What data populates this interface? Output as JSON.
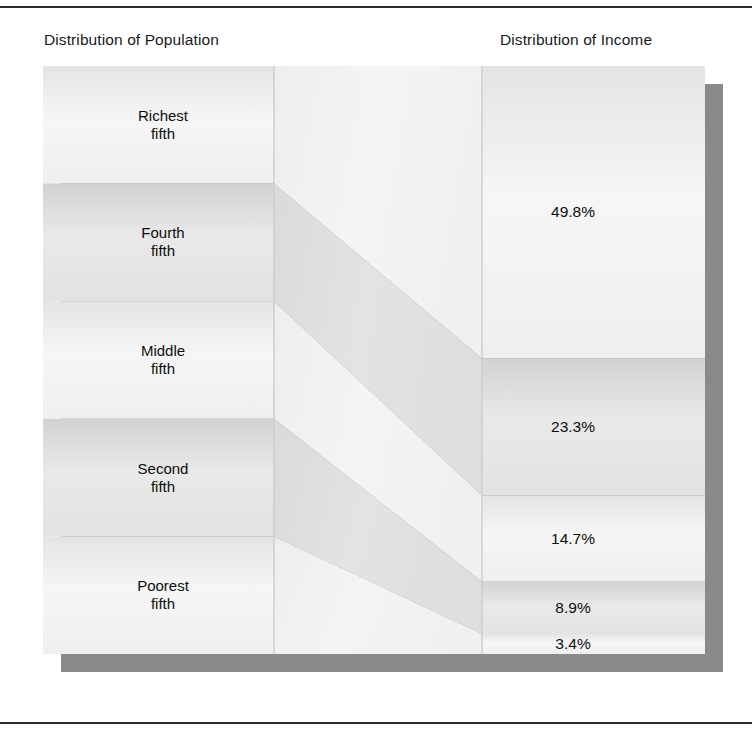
{
  "figure": {
    "left_title": "Distribution of Population",
    "right_title": "Distribution of Income",
    "background_color": "#ffffff",
    "band_light_color": "#f2f2f2",
    "band_dark_color": "#dcdcdc",
    "shadow_color": "#8a8a8a",
    "divider_color": "#c9c9c9",
    "text_color": "#0d0d0d"
  },
  "chart_data": {
    "type": "bar",
    "xlabel": "",
    "ylabel": "",
    "categories": [
      "Richest fifth",
      "Fourth fifth",
      "Middle fifth",
      "Second fifth",
      "Poorest fifth"
    ],
    "series": [
      {
        "name": "Distribution of Population",
        "values": [
          20.0,
          20.0,
          20.0,
          20.0,
          20.0
        ],
        "unit": "%"
      },
      {
        "name": "Distribution of Income",
        "values": [
          49.8,
          23.3,
          14.7,
          8.9,
          3.4
        ],
        "unit": "%"
      }
    ],
    "legend": [
      "Distribution of Population",
      "Distribution of Income"
    ],
    "grid": false,
    "ylim": [
      0,
      100
    ]
  },
  "population": {
    "items": [
      {
        "name": "richest-fifth",
        "line1": "Richest",
        "line2": "fifth",
        "share": 20.0
      },
      {
        "name": "fourth-fifth",
        "line1": "Fourth",
        "line2": "fifth",
        "share": 20.0
      },
      {
        "name": "middle-fifth",
        "line1": "Middle",
        "line2": "fifth",
        "share": 20.0
      },
      {
        "name": "second-fifth",
        "line1": "Second",
        "line2": "fifth",
        "share": 20.0
      },
      {
        "name": "poorest-fifth",
        "line1": "Poorest",
        "line2": "fifth",
        "share": 20.0
      }
    ]
  },
  "income": {
    "items": [
      {
        "name": "richest-fifth",
        "label": "49.8%",
        "share": 49.8
      },
      {
        "name": "fourth-fifth",
        "label": "23.3%",
        "share": 23.3
      },
      {
        "name": "middle-fifth",
        "label": "14.7%",
        "share": 14.7
      },
      {
        "name": "second-fifth",
        "label": "8.9%",
        "share": 8.9
      },
      {
        "name": "poorest-fifth",
        "label": "3.4%",
        "share": 3.4
      }
    ]
  }
}
